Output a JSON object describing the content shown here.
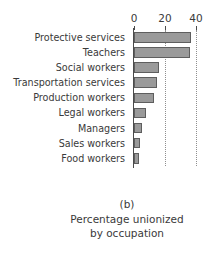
{
  "chart_data": {
    "type": "bar",
    "orientation": "horizontal",
    "title": "",
    "panel_letter": "(b)",
    "caption_lines": [
      "Percentage unionized",
      "by occupation"
    ],
    "xlabel": "",
    "ylabel": "",
    "categories": [
      "Protective services",
      "Teachers",
      "Social workers",
      "Transportation services",
      "Production workers",
      "Legal workers",
      "Managers",
      "Sales workers",
      "Food workers"
    ],
    "values": [
      37,
      36,
      16,
      15,
      13,
      8,
      5,
      4,
      3
    ],
    "xlim": [
      0,
      46
    ],
    "xticks": [
      0,
      20,
      40
    ],
    "xtick_labels": [
      "0",
      "20",
      "40"
    ],
    "grid": "vertical-dotted",
    "legend": "none",
    "bar_fill": "#9a9a9a",
    "bar_edge": "#5e5e5e",
    "axis_color": "#4a4a4a",
    "gridline_color": "#8f8f8f"
  }
}
